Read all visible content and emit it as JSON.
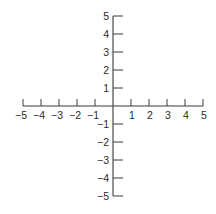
{
  "figure": {
    "type": "coordinate-axes",
    "origin_px": [
      113,
      106
    ],
    "unit_px": 18,
    "line_color": "#3a3a3a",
    "label_color": "#2a2a2a"
  },
  "x_axis": {
    "min": -5,
    "max": 5,
    "ticks": [
      -5,
      -4,
      -3,
      -2,
      -1,
      1,
      2,
      3,
      4,
      5
    ],
    "labels": [
      "−5",
      "−4",
      "−3",
      "−2",
      "−1",
      "1",
      "2",
      "3",
      "4",
      "5"
    ]
  },
  "y_axis": {
    "min": -5,
    "max": 5,
    "ticks": [
      5,
      4,
      3,
      2,
      1,
      -1,
      -2,
      -3,
      -4,
      -5
    ],
    "labels": [
      "5",
      "4",
      "3",
      "2",
      "1",
      "−1",
      "−2",
      "−3",
      "−4",
      "−5"
    ]
  }
}
